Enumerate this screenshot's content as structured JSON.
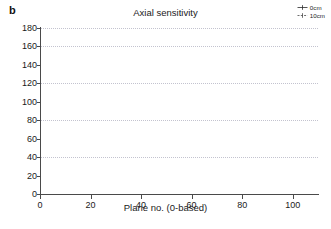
{
  "figure": {
    "panel_label": "b",
    "title": "Axial sensitivity"
  },
  "legend": {
    "position": "top-right",
    "entries": [
      {
        "label": "0cm",
        "marker": "line-plus-marker",
        "color": "#2b2b2b"
      },
      {
        "label": "10cm",
        "marker": "line-plus-marker",
        "color": "#555555"
      }
    ]
  },
  "axes": {
    "xlabel": "Plane no. (0-based)",
    "ylabel": "Countrate/Activity [cps/MBq]",
    "xticks": [
      0,
      20,
      40,
      60,
      80,
      100
    ],
    "yticks": [
      0,
      20,
      40,
      60,
      80,
      100,
      120,
      140,
      160,
      180
    ],
    "gridlines_y": [
      40,
      80,
      120,
      160,
      180
    ],
    "xlim": [
      0,
      110
    ],
    "ylim": [
      0,
      180
    ]
  },
  "chart_data": {
    "type": "line",
    "title": "Axial sensitivity",
    "xlabel": "Plane no. (0-based)",
    "ylabel": "Countrate/Activity [cps/MBq]",
    "xlim": [
      0,
      110
    ],
    "ylim": [
      0,
      180
    ],
    "grid": true,
    "legend_position": "top right",
    "x": [
      0,
      1,
      2,
      3,
      4,
      5,
      6,
      7,
      8,
      9,
      10,
      11,
      12,
      13,
      14,
      15,
      16,
      17,
      18,
      19,
      20,
      21,
      22,
      23,
      24,
      25,
      26,
      27,
      28,
      29,
      30,
      31,
      32,
      33,
      34,
      35,
      36,
      37,
      38,
      39,
      40,
      41,
      42,
      43,
      44,
      45,
      46,
      47,
      48,
      49,
      50,
      51,
      52,
      53,
      54,
      55,
      56,
      57,
      58,
      59,
      60,
      61,
      62,
      63,
      64,
      65,
      66,
      67,
      68,
      69,
      70,
      71,
      72,
      73,
      74,
      75,
      76,
      77,
      78,
      79,
      80,
      81,
      82,
      83,
      84,
      85,
      86,
      87,
      88,
      89,
      90,
      91,
      92,
      93,
      94,
      95,
      96,
      97,
      98,
      99,
      100,
      101,
      102,
      103,
      104,
      105,
      106,
      107,
      108,
      109
    ],
    "series": [
      {
        "name": "0cm",
        "values": [
          2,
          6,
          10,
          14,
          18,
          22,
          25,
          29,
          32,
          36,
          40,
          43,
          45,
          44,
          44,
          46,
          49,
          53,
          57,
          61,
          64,
          68,
          71,
          75,
          79,
          84,
          91,
          88,
          87,
          89,
          93,
          97,
          100,
          103,
          107,
          110,
          114,
          117,
          121,
          126,
          137,
          130,
          128,
          130,
          133,
          137,
          141,
          144,
          148,
          152,
          153,
          151,
          153,
          156,
          162,
          156,
          152,
          154,
          151,
          150,
          153,
          148,
          144,
          140,
          135,
          131,
          127,
          124,
          137,
          126,
          123,
          120,
          117,
          114,
          111,
          107,
          103,
          99,
          96,
          93,
          89,
          86,
          92,
          87,
          83,
          79,
          75,
          71,
          67,
          63,
          59,
          55,
          52,
          48,
          45,
          42,
          44,
          40,
          36,
          32,
          28,
          24,
          20,
          15,
          10,
          6,
          9,
          7,
          3,
          0
        ]
      },
      {
        "name": "10cm",
        "values": [
          2,
          6,
          10,
          14,
          18,
          22,
          25,
          28,
          32,
          35,
          39,
          42,
          44,
          43,
          43,
          45,
          48,
          52,
          56,
          60,
          63,
          67,
          70,
          74,
          78,
          83,
          89,
          86,
          86,
          88,
          92,
          96,
          99,
          102,
          106,
          109,
          113,
          116,
          120,
          124,
          134,
          128,
          126,
          128,
          131,
          135,
          139,
          142,
          146,
          150,
          151,
          149,
          151,
          154,
          160,
          154,
          150,
          152,
          149,
          148,
          151,
          146,
          142,
          138,
          133,
          129,
          125,
          122,
          135,
          124,
          121,
          118,
          115,
          112,
          109,
          105,
          101,
          97,
          94,
          91,
          87,
          84,
          90,
          85,
          81,
          77,
          73,
          69,
          65,
          61,
          57,
          53,
          50,
          46,
          43,
          40,
          42,
          38,
          34,
          30,
          26,
          22,
          18,
          13,
          8,
          4,
          7,
          5,
          2,
          0
        ]
      }
    ]
  }
}
